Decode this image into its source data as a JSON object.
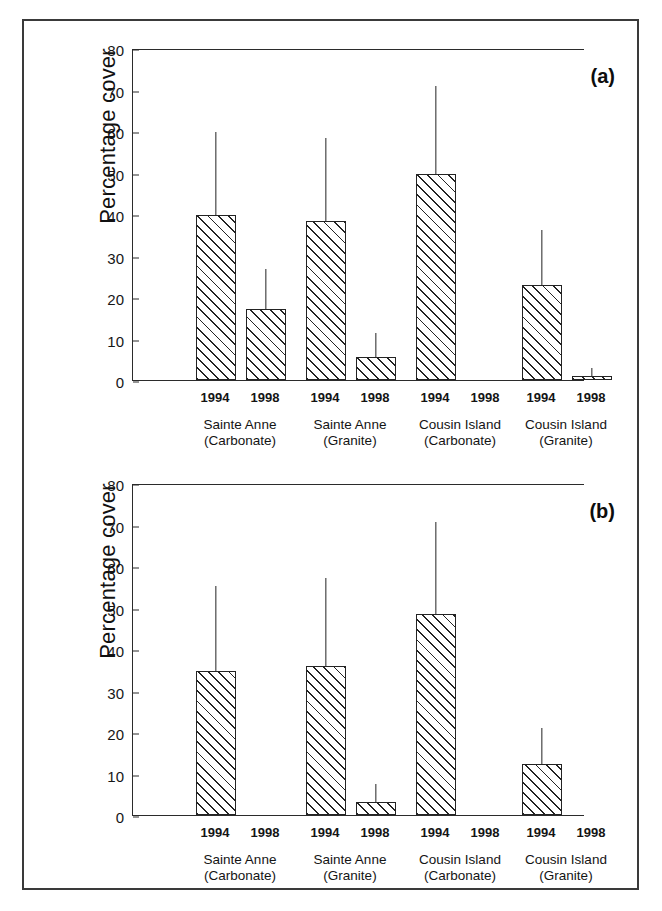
{
  "figure": {
    "panels": [
      {
        "tag": "(a)"
      },
      {
        "tag": "(b)"
      }
    ]
  },
  "chart_data": [
    {
      "type": "bar",
      "title": "(a)",
      "xlabel": "",
      "ylabel": "Percentage cover",
      "ylim": [
        0,
        80
      ],
      "yticks": [
        0,
        10,
        20,
        30,
        40,
        50,
        60,
        70,
        80
      ],
      "ytick_labels": [
        "0",
        "10",
        "20",
        "30",
        "40",
        "50",
        "60",
        "70",
        "80"
      ],
      "grid": false,
      "legend": "none",
      "error_bars": "upper only",
      "groups": [
        {
          "name": "Sainte Anne",
          "substrate": "(Carbonate)",
          "label_lines": [
            "Sainte Anne",
            "(Carbonate)"
          ],
          "bars": [
            {
              "year": "1994",
              "value": 39.8,
              "error_top": 59.7
            },
            {
              "year": "1998",
              "value": 17.1,
              "error_top": 26.8
            }
          ]
        },
        {
          "name": "Sainte Anne",
          "substrate": "(Granite)",
          "label_lines": [
            "Sainte Anne",
            "(Granite)"
          ],
          "bars": [
            {
              "year": "1994",
              "value": 38.3,
              "error_top": 58.2
            },
            {
              "year": "1998",
              "value": 5.5,
              "error_top": 11.4
            }
          ]
        },
        {
          "name": "Cousin Island",
          "substrate": "(Carbonate)",
          "label_lines": [
            "Cousin Island",
            "(Carbonate)"
          ],
          "bars": [
            {
              "year": "1994",
              "value": 49.6,
              "error_top": 70.8
            },
            {
              "year": "1998",
              "value": 0,
              "error_top": 0
            }
          ]
        },
        {
          "name": "Cousin Island",
          "substrate": "(Granite)",
          "label_lines": [
            "Cousin Island",
            "(Granite)"
          ],
          "bars": [
            {
              "year": "1994",
              "value": 23.0,
              "error_top": 36.2
            },
            {
              "year": "1998",
              "value": 1.0,
              "error_top": 3.0
            }
          ]
        }
      ]
    },
    {
      "type": "bar",
      "title": "(b)",
      "xlabel": "",
      "ylabel": "Percentage cover",
      "ylim": [
        0,
        80
      ],
      "yticks": [
        0,
        10,
        20,
        30,
        40,
        50,
        60,
        70,
        80
      ],
      "ytick_labels": [
        "0",
        "10",
        "20",
        "30",
        "40",
        "50",
        "60",
        "70",
        "80"
      ],
      "grid": false,
      "legend": "none",
      "error_bars": "upper only",
      "groups": [
        {
          "name": "Sainte Anne",
          "substrate": "(Carbonate)",
          "label_lines": [
            "Sainte Anne",
            "(Carbonate)"
          ],
          "bars": [
            {
              "year": "1994",
              "value": 34.7,
              "error_top": 55.3
            },
            {
              "year": "1998",
              "value": 0,
              "error_top": 0
            }
          ]
        },
        {
          "name": "Sainte Anne",
          "substrate": "(Granite)",
          "label_lines": [
            "Sainte Anne",
            "(Granite)"
          ],
          "bars": [
            {
              "year": "1994",
              "value": 35.9,
              "error_top": 57.0
            },
            {
              "year": "1998",
              "value": 3.1,
              "error_top": 7.4
            }
          ]
        },
        {
          "name": "Cousin Island",
          "substrate": "(Carbonate)",
          "label_lines": [
            "Cousin Island",
            "(Carbonate)"
          ],
          "bars": [
            {
              "year": "1994",
              "value": 48.4,
              "error_top": 70.6
            },
            {
              "year": "1998",
              "value": 0,
              "error_top": 0
            }
          ]
        },
        {
          "name": "Cousin Island",
          "substrate": "(Granite)",
          "label_lines": [
            "Cousin Island",
            "(Granite)"
          ],
          "bars": [
            {
              "year": "1994",
              "value": 12.4,
              "error_top": 20.9
            },
            {
              "year": "1998",
              "value": 0,
              "error_top": 0
            }
          ]
        }
      ]
    }
  ]
}
